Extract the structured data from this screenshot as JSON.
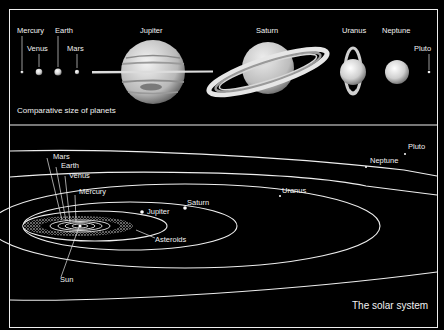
{
  "top_panel": {
    "caption": "Comparative size of planets",
    "planets": [
      {
        "name": "Mercury",
        "label": "Mercury"
      },
      {
        "name": "Venus",
        "label": "Venus"
      },
      {
        "name": "Earth",
        "label": "Earth"
      },
      {
        "name": "Mars",
        "label": "Mars"
      },
      {
        "name": "Jupiter",
        "label": "Jupiter"
      },
      {
        "name": "Saturn",
        "label": "Saturn"
      },
      {
        "name": "Uranus",
        "label": "Uranus"
      },
      {
        "name": "Neptune",
        "label": "Neptune"
      },
      {
        "name": "Pluto",
        "label": "Pluto"
      }
    ]
  },
  "bottom_panel": {
    "caption": "The solar system",
    "labels": {
      "mars": "Mars",
      "earth": "Earth",
      "venus": "Venus",
      "mercury": "Mercury",
      "jupiter": "Jupiter",
      "saturn": "Saturn",
      "uranus": "Uranus",
      "neptune": "Neptune",
      "pluto": "Pluto",
      "asteroids": "Asteroids",
      "sun": "Sun"
    }
  },
  "colors": {
    "background": "#000000",
    "line": "#f0f0f0",
    "text": "#f2f2f2"
  }
}
